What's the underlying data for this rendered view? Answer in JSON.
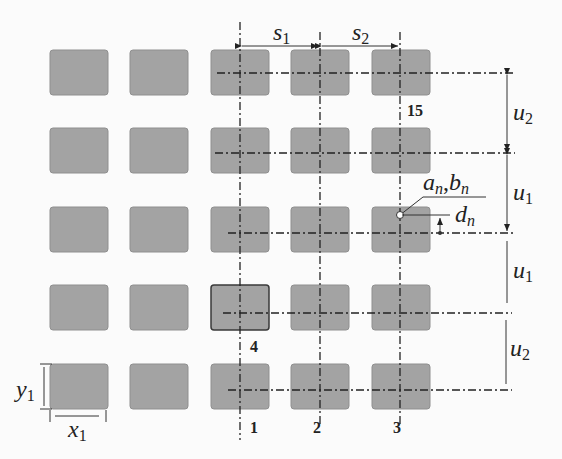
{
  "figure": {
    "grid": {
      "rows": 5,
      "cols": 5,
      "pad_color": "#a3a3a3"
    },
    "labels": {
      "s1": {
        "base": "s",
        "sub": "1"
      },
      "s2": {
        "base": "s",
        "sub": "2"
      },
      "u_top": {
        "base": "u",
        "sub": "2"
      },
      "u_mid1": {
        "base": "u",
        "sub": "1"
      },
      "u_mid2": {
        "base": "u",
        "sub": "1"
      },
      "u_bot": {
        "base": "u",
        "sub": "2"
      },
      "an": {
        "base": "a",
        "sub": "n"
      },
      "comma": ",",
      "bn": {
        "base": "b",
        "sub": "n"
      },
      "dn": {
        "base": "d",
        "sub": "n"
      },
      "y1": {
        "base": "y",
        "sub": "1"
      },
      "x1": {
        "base": "x",
        "sub": "1"
      }
    },
    "numbers": {
      "n1": "1",
      "n2": "2",
      "n3": "3",
      "n4": "4",
      "n15": "15"
    }
  }
}
